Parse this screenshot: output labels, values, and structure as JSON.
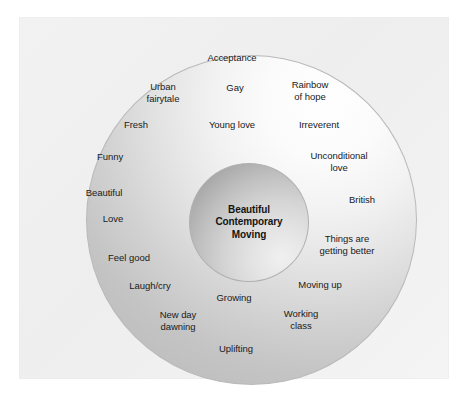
{
  "figure": {
    "type": "concentric-circle-diagram",
    "core": {
      "lines": [
        "Beautiful",
        "Contemporary",
        "Moving"
      ]
    },
    "ring_labels": [
      {
        "text": "Acceptance",
        "x": 232,
        "y": 58
      },
      {
        "text": "Urban\nfairytale",
        "x": 163,
        "y": 92
      },
      {
        "text": "Gay",
        "x": 235,
        "y": 88
      },
      {
        "text": "Rainbow\nof hope",
        "x": 310,
        "y": 90
      },
      {
        "text": "Fresh",
        "x": 136,
        "y": 125
      },
      {
        "text": "Young love",
        "x": 232,
        "y": 125
      },
      {
        "text": "Irreverent",
        "x": 319,
        "y": 125
      },
      {
        "text": "Funny",
        "x": 110,
        "y": 157
      },
      {
        "text": "Unconditional\nlove",
        "x": 339,
        "y": 161
      },
      {
        "text": "Beautiful",
        "x": 104,
        "y": 193
      },
      {
        "text": "British",
        "x": 362,
        "y": 200
      },
      {
        "text": "Love",
        "x": 113,
        "y": 219
      },
      {
        "text": "Things are\ngetting better",
        "x": 347,
        "y": 244
      },
      {
        "text": "Feel good",
        "x": 129,
        "y": 258
      },
      {
        "text": "Laugh/cry",
        "x": 150,
        "y": 286
      },
      {
        "text": "Moving up",
        "x": 320,
        "y": 285
      },
      {
        "text": "Growing",
        "x": 234,
        "y": 298
      },
      {
        "text": "New day\ndawning",
        "x": 178,
        "y": 320
      },
      {
        "text": "Working\nclass",
        "x": 301,
        "y": 319
      },
      {
        "text": "Uplifting",
        "x": 236,
        "y": 349
      }
    ],
    "colors": {
      "background": "#ffffff",
      "panel": "#f1f1f1",
      "outer_ring_light": "#ffffff",
      "outer_ring_dark": "#bdbdbd",
      "inner_circle_dark": "#9a9a9a",
      "outline": "#b9b9b9",
      "text": "#1a1a1a"
    }
  }
}
